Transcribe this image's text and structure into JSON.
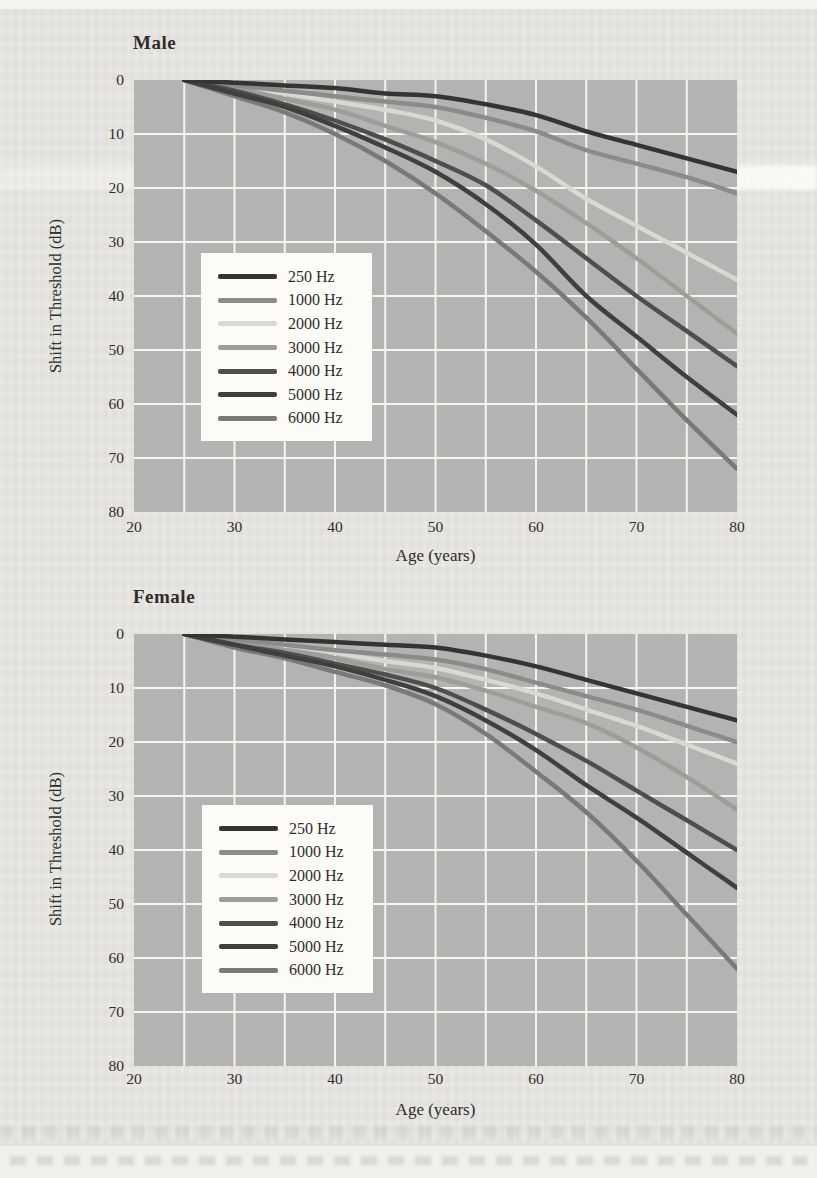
{
  "page": {
    "background_color": "#e7e6e2",
    "top_strip_color": "#f4f3ef",
    "text_color": "#2e2d2b",
    "plot_background_color": "#b4b3b1",
    "gridline_color": "#f5f4f0",
    "legend_background_color": "#fcfbf8"
  },
  "chart_data": [
    {
      "type": "line",
      "title": "Male",
      "xlabel": "Age (years)",
      "ylabel": "Shift in Threshold (dB)",
      "x_axis": {
        "min": 20,
        "max": 80,
        "ticks": [
          20,
          30,
          40,
          50,
          60,
          70,
          80
        ],
        "gridline_step": 5
      },
      "y_axis": {
        "min": 0,
        "max": 80,
        "inverted": true,
        "ticks": [
          0,
          10,
          20,
          30,
          40,
          50,
          60,
          70,
          80
        ],
        "gridline_step": 10
      },
      "x": [
        25,
        30,
        35,
        40,
        45,
        50,
        55,
        60,
        65,
        70,
        75,
        80
      ],
      "series": [
        {
          "name": "250 Hz",
          "color": "#343434",
          "values": [
            0,
            0.5,
            1,
            1.5,
            2.5,
            3,
            4.5,
            6.5,
            9.5,
            12,
            14.5,
            17
          ]
        },
        {
          "name": "1000 Hz",
          "color": "#8b8b89",
          "values": [
            0,
            1,
            2,
            3,
            4,
            5,
            7,
            9.5,
            13,
            15.5,
            18,
            21
          ]
        },
        {
          "name": "2000 Hz",
          "color": "#d9d8d1",
          "values": [
            0,
            1,
            2.5,
            4,
            5.5,
            7.5,
            11,
            16,
            22,
            27,
            32,
            37
          ]
        },
        {
          "name": "3000 Hz",
          "color": "#9e9d9a",
          "values": [
            0,
            1.5,
            3.5,
            5.5,
            8.5,
            11.5,
            15.5,
            20.5,
            26.5,
            33,
            40,
            47
          ]
        },
        {
          "name": "4000 Hz",
          "color": "#4e4e4c",
          "values": [
            0,
            2,
            4.5,
            7.5,
            11,
            15,
            19.5,
            26,
            33,
            40,
            46.5,
            53
          ]
        },
        {
          "name": "5000 Hz",
          "color": "#403f3e",
          "values": [
            0,
            2.5,
            5,
            8.5,
            12.5,
            17,
            23,
            30.5,
            40,
            47.5,
            55,
            62
          ]
        },
        {
          "name": "6000 Hz",
          "color": "#7a7977",
          "values": [
            0,
            3,
            6,
            10,
            15,
            21,
            28,
            35.5,
            44,
            53.5,
            63,
            72
          ]
        }
      ],
      "legend_position": "inside-lower-left",
      "grid": true
    },
    {
      "type": "line",
      "title": "Female",
      "xlabel": "Age (years)",
      "ylabel": "Shift in Threshold (dB)",
      "x_axis": {
        "min": 20,
        "max": 80,
        "ticks": [
          20,
          30,
          40,
          50,
          60,
          70,
          80
        ],
        "gridline_step": 5
      },
      "y_axis": {
        "min": 0,
        "max": 80,
        "inverted": true,
        "ticks": [
          0,
          10,
          20,
          30,
          40,
          50,
          60,
          70,
          80
        ],
        "gridline_step": 10
      },
      "x": [
        25,
        30,
        35,
        40,
        45,
        50,
        55,
        60,
        65,
        70,
        75,
        80
      ],
      "series": [
        {
          "name": "250 Hz",
          "color": "#343434",
          "values": [
            0,
            0.5,
            1,
            1.5,
            2,
            2.5,
            4,
            6,
            8.5,
            11,
            13.5,
            16
          ]
        },
        {
          "name": "1000 Hz",
          "color": "#8b8b89",
          "values": [
            0,
            1,
            2,
            3,
            3.8,
            4.7,
            6.5,
            9,
            11.5,
            14,
            17,
            20
          ]
        },
        {
          "name": "2000 Hz",
          "color": "#d9d8d1",
          "values": [
            0,
            1,
            2,
            3.5,
            5,
            6.3,
            8.5,
            11,
            14,
            17,
            20.5,
            24
          ]
        },
        {
          "name": "3000 Hz",
          "color": "#9e9d9a",
          "values": [
            0,
            1.5,
            3,
            4.5,
            6.5,
            8,
            10.5,
            13.5,
            16.5,
            21,
            26.5,
            32.5
          ]
        },
        {
          "name": "4000 Hz",
          "color": "#4e4e4c",
          "values": [
            0,
            2,
            3.5,
            5.5,
            7.5,
            10,
            14,
            18.5,
            23.5,
            29,
            34.5,
            40
          ]
        },
        {
          "name": "5000 Hz",
          "color": "#403f3e",
          "values": [
            0,
            2,
            4,
            6,
            8.5,
            11.5,
            16,
            21.5,
            28,
            34,
            40.5,
            47
          ]
        },
        {
          "name": "6000 Hz",
          "color": "#7a7977",
          "values": [
            0,
            2.5,
            4.5,
            7,
            9.5,
            13,
            18.5,
            25.5,
            33,
            42,
            52,
            62
          ]
        }
      ],
      "legend_position": "inside-lower-left",
      "grid": true
    }
  ]
}
